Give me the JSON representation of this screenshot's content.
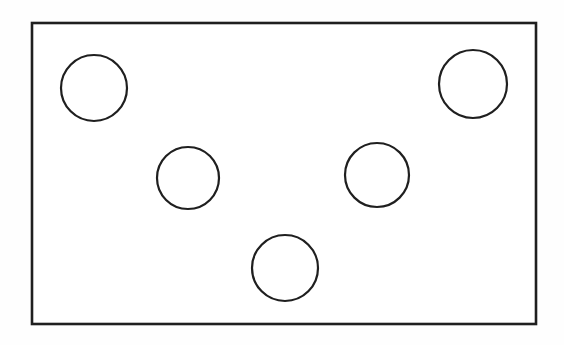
{
  "figure": {
    "kind": "line-drawing",
    "description": "Rectangle outline containing five circles arranged in a quincunx (domino five) pattern",
    "canvas": {
      "width": 564,
      "height": 345,
      "background_color": "#fefefe"
    },
    "stroke_color": "#1f1f1f",
    "fill_color": "#ffffff",
    "container": {
      "name": "rectangle",
      "x": 32,
      "y": 23,
      "width": 504,
      "height": 301,
      "stroke_width": 2.6
    },
    "circles": [
      {
        "label": "top-left",
        "cx": 94,
        "cy": 88,
        "r": 33,
        "stroke_width": 2.2
      },
      {
        "label": "top-right",
        "cx": 473,
        "cy": 84,
        "r": 34,
        "stroke_width": 2.2
      },
      {
        "label": "middle-left",
        "cx": 188,
        "cy": 178,
        "r": 31,
        "stroke_width": 2.2
      },
      {
        "label": "middle-right",
        "cx": 377,
        "cy": 175,
        "r": 32,
        "stroke_width": 2.2
      },
      {
        "label": "bottom-center",
        "cx": 285,
        "cy": 268,
        "r": 33,
        "stroke_width": 2.2
      }
    ],
    "circle_count": 5
  }
}
